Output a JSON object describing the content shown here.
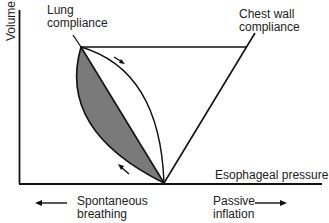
{
  "diagram": {
    "axes": {
      "y_label": "Volume",
      "x_label": "Esophageal pressure"
    },
    "curves": {
      "lung": {
        "label_line1": "Lung",
        "label_line2": "compliance"
      },
      "chest_wall": {
        "label_line1": "Chest wall",
        "label_line2": "compliance"
      }
    },
    "directions": {
      "left": {
        "label_line1": "Spontaneous",
        "label_line2": "breathing"
      },
      "right": {
        "label_line1": "Passive",
        "label_line2": "inflation"
      }
    },
    "colors": {
      "line": "#111111",
      "shaded_area": "#7a7a7a",
      "background": "#ffffff"
    }
  }
}
